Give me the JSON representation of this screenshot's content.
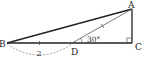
{
  "diagram": {
    "type": "geometry",
    "points": {
      "A": {
        "label": "A",
        "x": 132,
        "y": 9
      },
      "B": {
        "label": "B",
        "x": 7,
        "y": 43
      },
      "C": {
        "label": "C",
        "x": 132,
        "y": 43
      },
      "D": {
        "label": "D",
        "x": 72,
        "y": 43
      }
    },
    "angle_label": "30°",
    "length_label": "2",
    "right_angle_at": "C",
    "equal_marks": [
      "BD",
      "DA"
    ],
    "colors": {
      "stroke": "#222222",
      "thin_stroke": "#555555",
      "dashed": "#777777"
    }
  }
}
